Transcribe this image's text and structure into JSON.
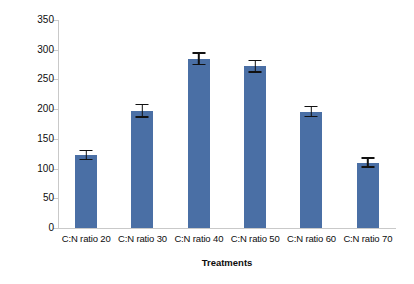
{
  "chart_data": {
    "type": "bar",
    "title": "",
    "xlabel": "Treatments",
    "ylabel": "Total Earthworm Biomass(g) / treatment",
    "categories": [
      "C:N ratio 20",
      "C:N ratio 30",
      "C:N ratio 40",
      "C:N ratio 50",
      "C:N ratio 60",
      "C:N ratio 70"
    ],
    "values": [
      123,
      197,
      285,
      272,
      196,
      110
    ],
    "errors": [
      9,
      12,
      11,
      11,
      10,
      9
    ],
    "ylim": [
      0,
      350
    ],
    "ytick_values": [
      0,
      50,
      100,
      150,
      200,
      250,
      300,
      350
    ],
    "ytick_labels": [
      "0",
      "50",
      "100",
      "150",
      "200",
      "250",
      "300",
      "350"
    ],
    "grid": false,
    "legend": false,
    "series": [
      {
        "name": "Total Earthworm Biomass",
        "values": [
          123,
          197,
          285,
          272,
          196,
          110
        ],
        "errors": [
          9,
          12,
          11,
          11,
          10,
          9
        ],
        "color": "#4a6fa5"
      }
    ]
  },
  "colors": {
    "bar": "#4a6fa5",
    "axis": "#c9c9c9",
    "text": "#0d0d0d",
    "errorbar": "#111111",
    "background": "#ffffff"
  }
}
